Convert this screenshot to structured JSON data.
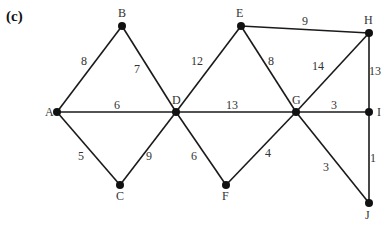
{
  "figure": {
    "label": "(c)"
  },
  "nodes": [
    {
      "id": "A",
      "x": 57,
      "y": 112,
      "lx": 45,
      "ly": 116
    },
    {
      "id": "B",
      "x": 122,
      "y": 26,
      "lx": 118,
      "ly": 17
    },
    {
      "id": "C",
      "x": 120,
      "y": 185,
      "lx": 116,
      "ly": 200
    },
    {
      "id": "D",
      "x": 176,
      "y": 112,
      "lx": 172,
      "ly": 104
    },
    {
      "id": "E",
      "x": 241,
      "y": 26,
      "lx": 236,
      "ly": 17
    },
    {
      "id": "F",
      "x": 226,
      "y": 185,
      "lx": 222,
      "ly": 200
    },
    {
      "id": "G",
      "x": 296,
      "y": 112,
      "lx": 292,
      "ly": 104
    },
    {
      "id": "H",
      "x": 369,
      "y": 33,
      "lx": 364,
      "ly": 24
    },
    {
      "id": "I",
      "x": 369,
      "y": 112,
      "lx": 377,
      "ly": 116
    },
    {
      "id": "J",
      "x": 369,
      "y": 203,
      "lx": 365,
      "ly": 219
    }
  ],
  "edges": [
    {
      "from": "A",
      "to": "B",
      "weight": "8",
      "wx": 84,
      "wy": 65
    },
    {
      "from": "B",
      "to": "D",
      "weight": "7",
      "wx": 137,
      "wy": 73
    },
    {
      "from": "A",
      "to": "D",
      "weight": "6",
      "wx": 117,
      "wy": 109
    },
    {
      "from": "A",
      "to": "C",
      "weight": "5",
      "wx": 81,
      "wy": 160
    },
    {
      "from": "C",
      "to": "D",
      "weight": "9",
      "wx": 149,
      "wy": 160
    },
    {
      "from": "D",
      "to": "E",
      "weight": "12",
      "wx": 197,
      "wy": 65
    },
    {
      "from": "E",
      "to": "G",
      "weight": "8",
      "wx": 271,
      "wy": 65
    },
    {
      "from": "E",
      "to": "H",
      "weight": "9",
      "wx": 305,
      "wy": 25
    },
    {
      "from": "D",
      "to": "G",
      "weight": "13",
      "wx": 232,
      "wy": 109
    },
    {
      "from": "D",
      "to": "F",
      "weight": "6",
      "wx": 194,
      "wy": 160
    },
    {
      "from": "F",
      "to": "G",
      "weight": "4",
      "wx": 268,
      "wy": 157
    },
    {
      "from": "G",
      "to": "H",
      "weight": "14",
      "wx": 318,
      "wy": 70
    },
    {
      "from": "G",
      "to": "I",
      "weight": "3",
      "wx": 334,
      "wy": 109
    },
    {
      "from": "H",
      "to": "I",
      "weight": "13",
      "wx": 375,
      "wy": 75
    },
    {
      "from": "G",
      "to": "J",
      "weight": "3",
      "wx": 326,
      "wy": 171
    },
    {
      "from": "I",
      "to": "J",
      "weight": "1",
      "wx": 373,
      "wy": 162
    }
  ],
  "style": {
    "edge_color": "#1a1a1a",
    "node_color": "#111111",
    "text_color": "#333333"
  }
}
